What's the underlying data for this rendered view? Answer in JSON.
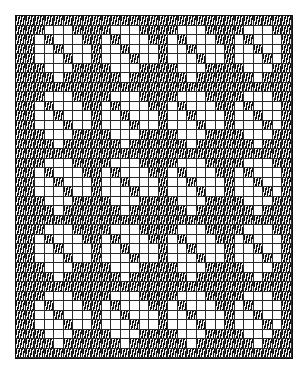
{
  "title": "",
  "chart_data": {
    "type": "table",
    "columns": 29,
    "rows": 36,
    "cell_size_px": 9.5,
    "colors": {
      "dark": "#111111",
      "light": "#ffffff",
      "grid_line": "#2a2a2a"
    },
    "motif": {
      "width": 7,
      "height": 7,
      "repeats_x": 4,
      "repeats_y": 5,
      "rows": [
        "DDDDDDD",
        "DDWWWDD",
        "DWDWWWD",
        "DWWDWWW",
        "DWWWDWW",
        "DDWWWDD",
        "DDDWDDD"
      ]
    },
    "border": {
      "left_column": "dark",
      "top_row": "dark",
      "bottom_row": "dark"
    }
  }
}
